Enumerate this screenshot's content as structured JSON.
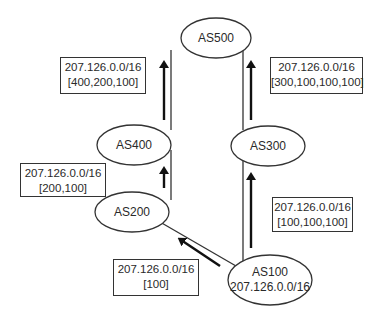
{
  "nodes": [
    {
      "id": "AS500",
      "label": "AS500"
    },
    {
      "id": "AS400",
      "label": "AS400"
    },
    {
      "id": "AS300",
      "label": "AS300"
    },
    {
      "id": "AS200",
      "label": "AS200"
    },
    {
      "id": "AS100",
      "label": "AS100",
      "sublabel": "207.126.0.0/16"
    }
  ],
  "routes": [
    {
      "prefix": "207.126.0.0/16",
      "path": "[400,200,100]",
      "from": "AS400",
      "to": "AS500"
    },
    {
      "prefix": "207.126.0.0/16",
      "path": "[300,100,100,100]",
      "from": "AS300",
      "to": "AS500"
    },
    {
      "prefix": "207.126.0.0/16",
      "path": "[200,100]",
      "from": "AS200",
      "to": "AS400"
    },
    {
      "prefix": "207.126.0.0/16",
      "path": "[100,100,100]",
      "from": "AS100",
      "to": "AS300"
    },
    {
      "prefix": "207.126.0.0/16",
      "path": "[100]",
      "from": "AS100",
      "to": "AS200"
    }
  ],
  "colors": {
    "line": "#333333",
    "arrow": "#111111",
    "background": "#ffffff"
  }
}
